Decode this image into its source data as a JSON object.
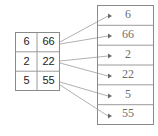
{
  "diagram": {
    "colors": {
      "border": "#8a8a8a",
      "rule": "#9a9a9a",
      "connector": "#a8a8a8",
      "arrow": "#6b6b6b",
      "cell_text": "#1a1a1a",
      "slot_text": "#6e6e6e",
      "background": "#ffffff"
    },
    "left_table": {
      "name": "key-value-table",
      "columns": 2,
      "rows": [
        {
          "key": "6",
          "value": "66"
        },
        {
          "key": "2",
          "value": "22"
        },
        {
          "key": "5",
          "value": "55"
        }
      ]
    },
    "right_table": {
      "name": "flat-slot-array",
      "slots": [
        {
          "label": "6"
        },
        {
          "label": "66"
        },
        {
          "label": "2"
        },
        {
          "label": "22"
        },
        {
          "label": "5"
        },
        {
          "label": "55"
        }
      ]
    },
    "connections": [
      {
        "from_row": 0,
        "from_field": "key",
        "to_slot": 0
      },
      {
        "from_row": 0,
        "from_field": "value",
        "to_slot": 1
      },
      {
        "from_row": 1,
        "from_field": "key",
        "to_slot": 2
      },
      {
        "from_row": 1,
        "from_field": "value",
        "to_slot": 3
      },
      {
        "from_row": 2,
        "from_field": "key",
        "to_slot": 4
      },
      {
        "from_row": 2,
        "from_field": "value",
        "to_slot": 5
      }
    ]
  }
}
